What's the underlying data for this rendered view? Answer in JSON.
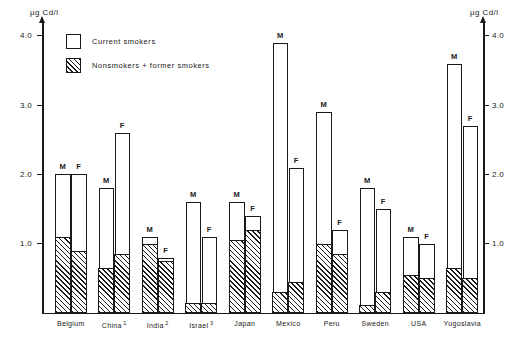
{
  "chart_data": {
    "type": "bar",
    "title": "",
    "xlabel": "",
    "ylabel": "µg Cd/l",
    "ylabel_right": "µg Cd/l",
    "ylim": [
      0,
      4.2
    ],
    "yticks": [
      1.0,
      2.0,
      3.0,
      4.0
    ],
    "ytick_labels_left": [
      "1.0",
      "2.0",
      "3.0",
      "4.0"
    ],
    "ytick_labels_right": [
      "1.0",
      "2.0",
      "3.0",
      "4.0"
    ],
    "grid": false,
    "legend_position": "upper-left-inside",
    "legend": [
      {
        "label": "Current smokers",
        "style": "open"
      },
      {
        "label": "Nonsmokers + former smokers",
        "style": "hatched"
      }
    ],
    "categories": [
      "Belgium",
      "China",
      "India",
      "Israel",
      "Japan",
      "Mexico",
      "Peru",
      "Sweden",
      "USA",
      "Yugoslavia"
    ],
    "category_footnotes": [
      "",
      "1",
      "2",
      "3",
      "",
      "",
      "",
      "",
      "",
      ""
    ],
    "sex_labels": [
      "M",
      "F"
    ],
    "series": [
      {
        "name": "Current smokers",
        "description": "Total bar height (current smokers)",
        "values_male": [
          2.0,
          1.8,
          1.1,
          1.6,
          1.6,
          3.9,
          2.9,
          1.8,
          1.1,
          3.6
        ],
        "values_female": [
          2.0,
          2.6,
          0.8,
          1.1,
          1.4,
          2.1,
          1.2,
          1.5,
          1.0,
          2.7
        ]
      },
      {
        "name": "Nonsmokers + former smokers",
        "description": "Hatched lower portion of each bar",
        "values_male": [
          1.1,
          0.65,
          1.0,
          0.15,
          1.05,
          0.3,
          1.0,
          0.12,
          0.55,
          0.65
        ],
        "values_female": [
          0.9,
          0.85,
          0.75,
          0.15,
          1.2,
          0.45,
          0.85,
          0.3,
          0.5,
          0.5
        ]
      }
    ]
  },
  "colors": {
    "ink": "#1a1a1a",
    "background": "#ffffff"
  }
}
